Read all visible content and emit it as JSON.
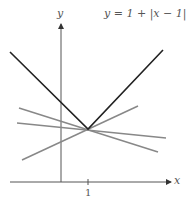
{
  "title": "y = 1 + |x − 1|",
  "axes": {
    "x_label": "x",
    "y_label": "y",
    "x_tick": "1"
  },
  "colors": {
    "main": "#222222",
    "tangent": "#888888",
    "axis": "#555555"
  },
  "geometry": {
    "vertex": [
      88,
      129
    ],
    "v_left": [
      10,
      52
    ],
    "v_right": [
      163,
      50
    ],
    "tangents": [
      {
        "x1": 19,
        "y1": 108,
        "x2": 158,
        "y2": 152
      },
      {
        "x1": 17,
        "y1": 123,
        "x2": 166,
        "y2": 138
      },
      {
        "x1": 22,
        "y1": 160,
        "x2": 138,
        "y2": 106
      }
    ]
  }
}
